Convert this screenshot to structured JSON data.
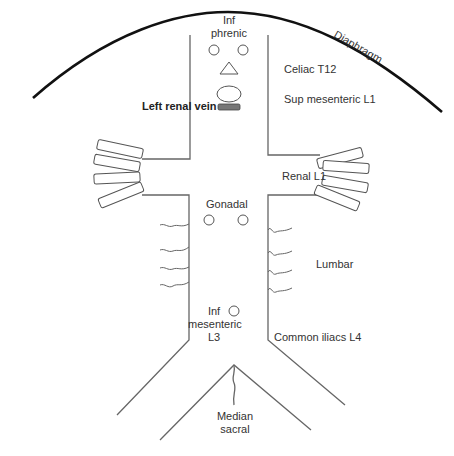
{
  "diagram": {
    "labels": {
      "diaphragm": "Diaphragm",
      "inf_phrenic_1": "Inf",
      "inf_phrenic_2": "phrenic",
      "celiac": "Celiac T12",
      "sup_mesenteric": "Sup mesenteric L1",
      "left_renal_vein": "Left renal vein",
      "renal": "Renal L1",
      "gonadal": "Gonadal",
      "lumbar": "Lumbar",
      "inf_mesenteric_1": "Inf",
      "inf_mesenteric_2": "mesenteric",
      "inf_mesenteric_3": "L3",
      "common_iliacs": "Common iliacs L4",
      "median_sacral_1": "Median",
      "median_sacral_2": "sacral"
    },
    "colors": {
      "line": "#666666",
      "diaphragm": "#111111",
      "vein_fill": "#777777",
      "text": "#333333"
    }
  }
}
